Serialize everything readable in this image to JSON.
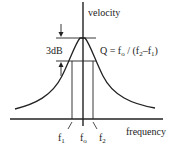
{
  "diagram": {
    "y_axis_label": "velocity",
    "x_axis_label": "frequency",
    "bandwidth_label": "3dB",
    "q_formula": {
      "prefix": "Q = f",
      "sub_o": "o",
      "mid": " / (f",
      "sub_2": "2",
      "minus": "–f",
      "sub_1": "1",
      "suffix": ")"
    },
    "tick_labels": [
      {
        "main": "f",
        "sub": "1"
      },
      {
        "main": "f",
        "sub": "o"
      },
      {
        "main": "f",
        "sub": "2"
      }
    ],
    "colors": {
      "line": "#222222",
      "background": "#ffffff"
    }
  }
}
